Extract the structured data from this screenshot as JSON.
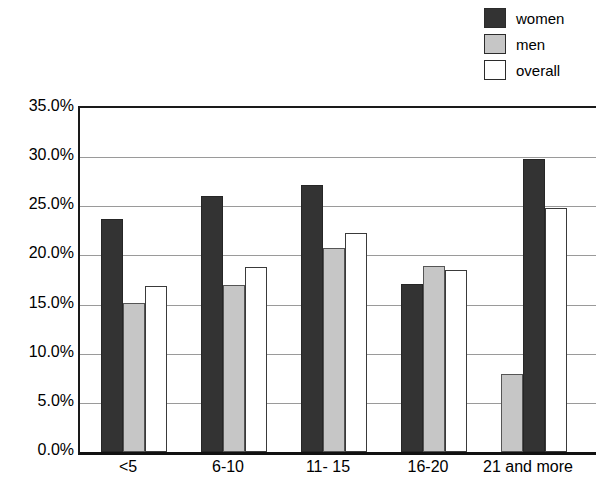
{
  "chart_data": {
    "type": "bar",
    "title": "",
    "subtitle": "",
    "xlabel": "",
    "ylabel": "",
    "categories": [
      "<5",
      "6-10",
      "11- 15",
      "16-20",
      "21 and more"
    ],
    "series": [
      {
        "name": "women",
        "color": "#333333",
        "values": [
          23.7,
          26.0,
          27.2,
          17.1,
          29.8
        ]
      },
      {
        "name": "men",
        "color": "#c6c6c6",
        "values": [
          15.2,
          17.0,
          20.8,
          18.9,
          7.9
        ]
      },
      {
        "name": "overall",
        "color": "#ffffff",
        "values": [
          16.9,
          18.8,
          22.3,
          18.5,
          24.8
        ]
      }
    ],
    "ylim": [
      0,
      35
    ],
    "ytick_values": [
      0,
      5,
      10,
      15,
      20,
      25,
      30,
      35
    ],
    "ytick_labels": [
      "0.0%",
      "5.0%",
      "10.0%",
      "15.0%",
      "20.0%",
      "25.0%",
      "30.0%",
      "35.0%"
    ],
    "grid": true,
    "grid_axis": "y",
    "legend_position": "top-right",
    "annotations": []
  },
  "legend": {
    "items": [
      {
        "label": "women",
        "swatch": "legend-swatch-women"
      },
      {
        "label": "men",
        "swatch": "legend-swatch-men"
      },
      {
        "label": "overall",
        "swatch": "legend-swatch-overall"
      }
    ]
  }
}
